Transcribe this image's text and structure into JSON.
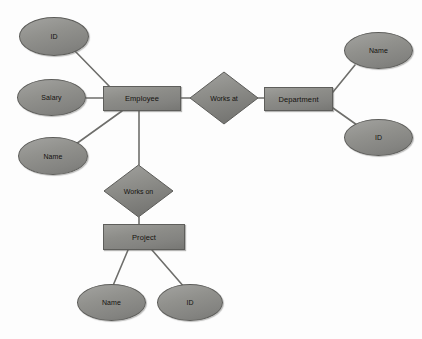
{
  "diagram": {
    "background_color": "#fdfdfd",
    "shape_fill": "#8d8d89",
    "shape_stroke": "#5c5c59",
    "edge_color": "#6e6e6b"
  },
  "entities": [
    {
      "id": "employee",
      "label": "Employee",
      "shape": "rectangle",
      "x": 103,
      "y": 86,
      "w": 78,
      "h": 25
    },
    {
      "id": "department",
      "label": "Department",
      "shape": "rectangle",
      "x": 264,
      "y": 87,
      "w": 69,
      "h": 24
    },
    {
      "id": "project",
      "label": "Project",
      "shape": "rectangle",
      "x": 103,
      "y": 224,
      "w": 82,
      "h": 26
    }
  ],
  "relationships": [
    {
      "id": "works-at",
      "label": "Works at",
      "shape": "diamond",
      "x": 189,
      "y": 71,
      "w": 70,
      "h": 54
    },
    {
      "id": "works-on",
      "label": "Works on",
      "shape": "diamond",
      "x": 103,
      "y": 164,
      "w": 71,
      "h": 54
    }
  ],
  "attributes": [
    {
      "id": "employee-id",
      "label": "ID",
      "owner": "employee",
      "x": 19,
      "y": 17,
      "w": 70,
      "h": 39
    },
    {
      "id": "employee-salary",
      "label": "Salary",
      "owner": "employee",
      "x": 17,
      "y": 79,
      "w": 69,
      "h": 37
    },
    {
      "id": "employee-name",
      "label": "Name",
      "owner": "employee",
      "x": 18,
      "y": 137,
      "w": 70,
      "h": 38
    },
    {
      "id": "department-name",
      "label": "Name",
      "owner": "department",
      "x": 344,
      "y": 32,
      "w": 69,
      "h": 37
    },
    {
      "id": "department-id",
      "label": "ID",
      "owner": "department",
      "x": 344,
      "y": 119,
      "w": 69,
      "h": 37
    },
    {
      "id": "project-name",
      "label": "Name",
      "owner": "project",
      "x": 77,
      "y": 284,
      "w": 69,
      "h": 37
    },
    {
      "id": "project-id",
      "label": "ID",
      "owner": "project",
      "x": 157,
      "y": 284,
      "w": 66,
      "h": 37
    }
  ],
  "edges": [
    {
      "id": "edge-employee-id",
      "from": "employee-id",
      "to": "employee",
      "x1": 74,
      "y1": 50,
      "x2": 110,
      "y2": 87
    },
    {
      "id": "edge-employee-salary",
      "from": "employee-salary",
      "to": "employee",
      "x1": 86,
      "y1": 98,
      "x2": 103,
      "y2": 98
    },
    {
      "id": "edge-employee-name",
      "from": "employee-name",
      "to": "employee",
      "x1": 76,
      "y1": 144,
      "x2": 122,
      "y2": 111
    },
    {
      "id": "edge-employee-worksat",
      "from": "employee",
      "to": "works-at",
      "x1": 181,
      "y1": 98,
      "x2": 190,
      "y2": 98
    },
    {
      "id": "edge-worksat-department",
      "from": "works-at",
      "to": "department",
      "x1": 258,
      "y1": 98,
      "x2": 264,
      "y2": 98
    },
    {
      "id": "edge-department-name",
      "from": "department",
      "to": "department-name",
      "x1": 333,
      "y1": 92,
      "x2": 355,
      "y2": 65
    },
    {
      "id": "edge-department-id",
      "from": "department",
      "to": "department-id",
      "x1": 333,
      "y1": 108,
      "x2": 357,
      "y2": 125
    },
    {
      "id": "edge-employee-workson",
      "from": "employee",
      "to": "works-on",
      "x1": 139,
      "y1": 111,
      "x2": 139,
      "y2": 165
    },
    {
      "id": "edge-workson-project",
      "from": "works-on",
      "to": "project",
      "x1": 139,
      "y1": 217,
      "x2": 139,
      "y2": 224
    },
    {
      "id": "edge-project-name",
      "from": "project",
      "to": "project-name",
      "x1": 128,
      "y1": 250,
      "x2": 112,
      "y2": 288
    },
    {
      "id": "edge-project-id",
      "from": "project",
      "to": "project-id",
      "x1": 152,
      "y1": 250,
      "x2": 185,
      "y2": 288
    }
  ]
}
